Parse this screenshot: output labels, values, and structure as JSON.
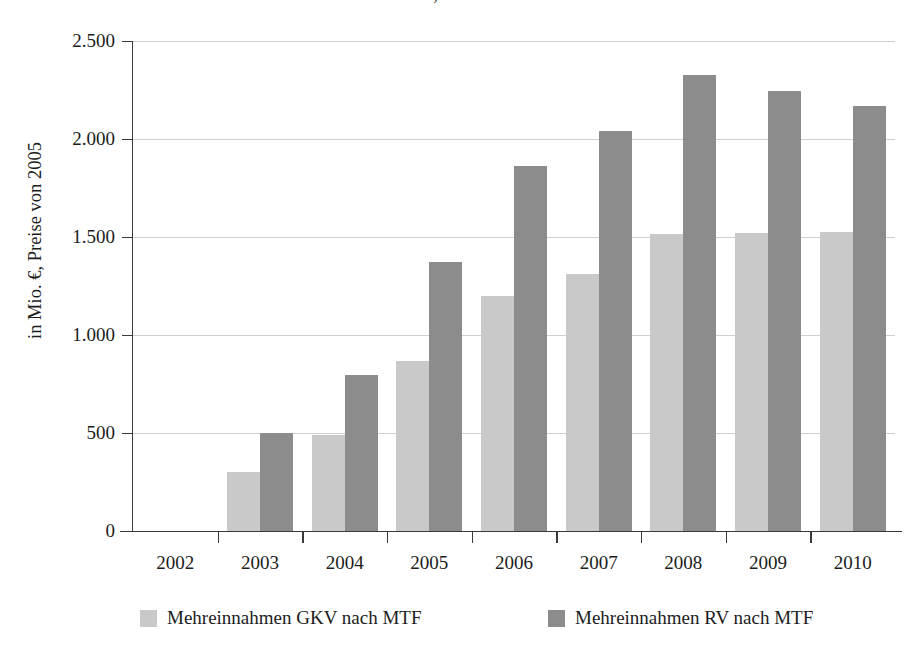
{
  "chart_data": {
    "type": "bar",
    "title": "und RV, 2002 – 2010",
    "xlabel": "",
    "ylabel": "in Mio. €, Preise von 2005",
    "categories": [
      "2002",
      "2003",
      "2004",
      "2005",
      "2006",
      "2007",
      "2008",
      "2009",
      "2010"
    ],
    "series": [
      {
        "name": "Mehreinnahmen GKV nach MTF",
        "color": "#c9c9c9",
        "values": [
          0,
          300,
          490,
          865,
          1200,
          1310,
          1515,
          1520,
          1525
        ]
      },
      {
        "name": "Mehreinnahmen RV nach MTF",
        "color": "#8c8c8c",
        "values": [
          0,
          500,
          795,
          1370,
          1860,
          2040,
          2325,
          2245,
          2170
        ]
      }
    ],
    "ylim": [
      0,
      2500
    ],
    "ytick_labels": [
      "0",
      "500",
      "1.000",
      "1.500",
      "2.000",
      "2.500"
    ],
    "ytick_values": [
      0,
      500,
      1000,
      1500,
      2000,
      2500
    ],
    "grid": true,
    "legend_position": "bottom"
  },
  "legend": {
    "entries": [
      {
        "label": "Mehreinnahmen GKV nach MTF",
        "swatch": "light"
      },
      {
        "label": "Mehreinnahmen RV nach MTF",
        "swatch": "dark"
      }
    ]
  }
}
